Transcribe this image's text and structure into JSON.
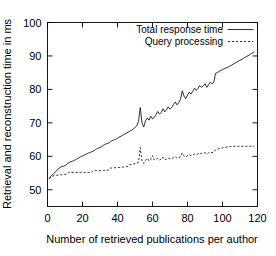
{
  "chart_data": {
    "type": "line",
    "title": "",
    "xlabel": "Number of retrieved publications per author",
    "ylabel": "Retrieval and reconstruction time in ms",
    "xlim": [
      0,
      120
    ],
    "ylim": [
      45,
      100
    ],
    "xticks": [
      0,
      20,
      40,
      60,
      80,
      100,
      120
    ],
    "yticks": [
      50,
      60,
      70,
      80,
      90,
      100
    ],
    "xtick_labels": [
      "0",
      "20",
      "40",
      "60",
      "80",
      "100",
      "120"
    ],
    "ytick_labels": [
      "50",
      "60",
      "70",
      "80",
      "90",
      "100"
    ],
    "grid": false,
    "legend_position": "top-right-inside",
    "series": [
      {
        "name": "Total response time",
        "style": "solid",
        "color": "#000000",
        "x": [
          1,
          2,
          3,
          4,
          5,
          6,
          7,
          8,
          9,
          10,
          11,
          12,
          13,
          14,
          15,
          16,
          17,
          18,
          19,
          20,
          21,
          22,
          23,
          24,
          25,
          26,
          27,
          28,
          29,
          30,
          31,
          32,
          33,
          34,
          35,
          36,
          37,
          38,
          39,
          40,
          41,
          42,
          43,
          44,
          45,
          46,
          47,
          48,
          49,
          50,
          51,
          52,
          53,
          54,
          55,
          56,
          57,
          58,
          59,
          60,
          61,
          62,
          63,
          64,
          65,
          66,
          67,
          68,
          69,
          70,
          71,
          72,
          73,
          74,
          75,
          76,
          77,
          78,
          79,
          80,
          81,
          82,
          83,
          84,
          85,
          86,
          87,
          88,
          89,
          90,
          91,
          92,
          93,
          94,
          95,
          96,
          97,
          98,
          100,
          102,
          104,
          106,
          108,
          110,
          112,
          114,
          116,
          118
        ],
        "y": [
          53.4,
          54.1,
          54.6,
          55.0,
          55.6,
          56.2,
          56.6,
          56.9,
          57.0,
          57.2,
          57.6,
          58.0,
          58.3,
          58.5,
          58.7,
          59.0,
          59.3,
          59.6,
          59.9,
          60.1,
          60.3,
          60.6,
          60.9,
          61.1,
          61.3,
          61.5,
          61.8,
          62.2,
          62.5,
          62.6,
          62.9,
          63.3,
          63.6,
          63.8,
          64.0,
          64.4,
          64.7,
          64.9,
          65.1,
          65.4,
          65.8,
          66.0,
          66.3,
          66.6,
          66.9,
          67.2,
          67.5,
          67.8,
          68.2,
          68.6,
          69.1,
          70.4,
          74.6,
          70.0,
          68.8,
          70.6,
          71.5,
          70.8,
          72.0,
          71.2,
          71.6,
          72.5,
          73.4,
          72.6,
          73.1,
          74.2,
          73.3,
          73.9,
          74.8,
          74.1,
          74.6,
          75.5,
          76.2,
          75.4,
          76.1,
          77.0,
          79.6,
          78.0,
          77.2,
          78.3,
          79.2,
          78.6,
          79.4,
          80.4,
          79.7,
          80.3,
          81.2,
          80.6,
          81.0,
          81.7,
          80.6,
          81.4,
          82.2,
          81.7,
          82.1,
          84.8,
          85.0,
          85.4,
          85.9,
          86.4,
          86.9,
          87.5,
          88.1,
          88.7,
          89.3,
          89.9,
          90.5,
          91.2
        ]
      },
      {
        "name": "Query processing",
        "style": "dashed",
        "color": "#000000",
        "x": [
          1,
          2,
          3,
          4,
          5,
          6,
          7,
          8,
          9,
          10,
          11,
          12,
          13,
          14,
          15,
          16,
          17,
          18,
          19,
          20,
          21,
          22,
          23,
          24,
          25,
          26,
          27,
          28,
          29,
          30,
          31,
          32,
          33,
          34,
          35,
          36,
          37,
          38,
          39,
          40,
          41,
          42,
          43,
          44,
          45,
          46,
          47,
          48,
          49,
          50,
          51,
          52,
          53,
          54,
          55,
          56,
          57,
          58,
          59,
          60,
          61,
          62,
          63,
          64,
          65,
          66,
          67,
          68,
          69,
          70,
          71,
          72,
          73,
          74,
          75,
          76,
          77,
          78,
          79,
          80,
          81,
          82,
          83,
          84,
          85,
          86,
          87,
          88,
          89,
          90,
          91,
          92,
          93,
          94,
          95,
          96,
          97,
          98,
          100,
          102,
          104,
          106,
          108,
          110,
          112,
          114,
          116,
          118
        ],
        "y": [
          53.3,
          53.8,
          54.1,
          54.2,
          54.3,
          54.4,
          54.5,
          54.5,
          54.6,
          54.6,
          54.7,
          55.2,
          55.2,
          55.2,
          55.2,
          55.2,
          55.2,
          55.2,
          55.2,
          55.2,
          55.2,
          55.2,
          55.2,
          55.2,
          55.2,
          55.7,
          55.7,
          55.7,
          55.7,
          55.7,
          55.8,
          55.8,
          55.8,
          55.8,
          56.0,
          56.5,
          56.5,
          56.6,
          56.6,
          56.6,
          56.7,
          56.7,
          56.8,
          56.8,
          56.9,
          57.0,
          57.5,
          57.6,
          57.7,
          57.8,
          57.9,
          58.2,
          62.6,
          58.4,
          57.9,
          58.8,
          59.4,
          58.6,
          59.0,
          60.2,
          58.9,
          59.1,
          59.4,
          58.9,
          59.2,
          59.8,
          59.0,
          59.2,
          59.5,
          59.2,
          59.3,
          59.6,
          59.9,
          59.4,
          59.6,
          59.9,
          61.0,
          60.1,
          59.8,
          60.2,
          60.5,
          60.2,
          60.4,
          60.7,
          60.5,
          60.7,
          61.0,
          60.8,
          60.9,
          61.1,
          60.7,
          61.0,
          61.3,
          61.1,
          61.2,
          61.9,
          62.1,
          62.3,
          62.5,
          62.7,
          62.9,
          63.0,
          63.0,
          63.0,
          63.0,
          63.0,
          63.0,
          63.0
        ]
      }
    ]
  }
}
